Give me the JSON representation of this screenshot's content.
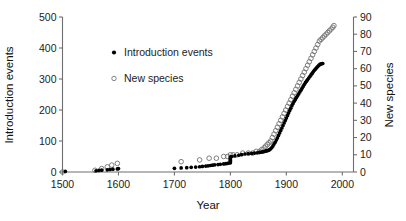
{
  "chart_data": {
    "type": "scatter",
    "title": "",
    "xlabel": "Year",
    "ylabel_left": "Introduction events",
    "ylabel_right": "New species",
    "xlim": [
      1500,
      2020
    ],
    "ylim_left": [
      0,
      500
    ],
    "ylim_right": [
      0,
      90
    ],
    "grid": false,
    "legend_position": "upper-left-inside",
    "xticks": [
      1500,
      1600,
      1700,
      1800,
      1900,
      2000
    ],
    "yticks_left": [
      0,
      100,
      200,
      300,
      400,
      500
    ],
    "yticks_right": [
      0,
      10,
      20,
      30,
      40,
      50,
      60,
      70,
      80,
      90
    ],
    "series": [
      {
        "name": "Introduction events",
        "marker": "filled-circle",
        "color": "#000000",
        "axis": "left",
        "x": [
          1505,
          1560,
          1565,
          1570,
          1580,
          1585,
          1590,
          1598,
          1600,
          1700,
          1712,
          1722,
          1730,
          1738,
          1745,
          1750,
          1756,
          1760,
          1764,
          1768,
          1772,
          1778,
          1782,
          1788,
          1792,
          1795,
          1798,
          1800,
          1800,
          1800,
          1800,
          1800,
          1800,
          1800,
          1802,
          1808,
          1815,
          1820,
          1826,
          1832,
          1838,
          1843,
          1848,
          1852,
          1855,
          1858,
          1860,
          1862,
          1864,
          1866,
          1868,
          1870,
          1872,
          1874,
          1876,
          1878,
          1880,
          1882,
          1884,
          1886,
          1888,
          1890,
          1892,
          1894,
          1896,
          1898,
          1900,
          1902,
          1904,
          1906,
          1908,
          1910,
          1912,
          1914,
          1916,
          1918,
          1920,
          1922,
          1924,
          1926,
          1928,
          1930,
          1932,
          1934,
          1936,
          1938,
          1940,
          1942,
          1944,
          1946,
          1948,
          1950,
          1952,
          1954,
          1956,
          1958,
          1960,
          1962,
          1964,
          1965
        ],
        "y": [
          2,
          4,
          5,
          6,
          7,
          8,
          9,
          10,
          11,
          12,
          13,
          14,
          15,
          16,
          17,
          18,
          19,
          20,
          21,
          22,
          23,
          24,
          25,
          26,
          27,
          28,
          29,
          30,
          33,
          36,
          39,
          42,
          45,
          48,
          50,
          52,
          54,
          56,
          58,
          59,
          60,
          61,
          62,
          63,
          64,
          65,
          66,
          67,
          68,
          69,
          70,
          72,
          75,
          79,
          84,
          90,
          96,
          103,
          110,
          118,
          126,
          134,
          142,
          150,
          158,
          166,
          174,
          182,
          190,
          198,
          206,
          214,
          221,
          228,
          234,
          240,
          246,
          252,
          258,
          264,
          270,
          276,
          282,
          288,
          293,
          298,
          303,
          308,
          313,
          318,
          323,
          328,
          332,
          336,
          340,
          344,
          347,
          349,
          350,
          350
        ]
      },
      {
        "name": "New species",
        "marker": "open-circle",
        "color": "#777777",
        "axis": "right",
        "x": [
          1500,
          1558,
          1570,
          1580,
          1588,
          1598,
          1712,
          1745,
          1762,
          1775,
          1788,
          1795,
          1800,
          1805,
          1812,
          1822,
          1832,
          1840,
          1846,
          1852,
          1856,
          1860,
          1863,
          1866,
          1869,
          1872,
          1875,
          1878,
          1881,
          1884,
          1887,
          1890,
          1893,
          1896,
          1899,
          1902,
          1905,
          1908,
          1911,
          1914,
          1917,
          1920,
          1923,
          1926,
          1929,
          1932,
          1935,
          1938,
          1941,
          1944,
          1947,
          1950,
          1953,
          1956,
          1959,
          1962,
          1965,
          1968,
          1971,
          1974,
          1977,
          1980,
          1983,
          1985
        ],
        "y": [
          0,
          1,
          2,
          3,
          4,
          5,
          6,
          7,
          8,
          8,
          9,
          9,
          10,
          10,
          10,
          11,
          11,
          11,
          12,
          12,
          13,
          14,
          15,
          16,
          17,
          18,
          20,
          22,
          24,
          26,
          28,
          30,
          32,
          34,
          36,
          38,
          40,
          42,
          44,
          46,
          48,
          50,
          52,
          54,
          56,
          58,
          60,
          62,
          64,
          66,
          68,
          70,
          72,
          74,
          76,
          77,
          78,
          79,
          80,
          81,
          82,
          83,
          84,
          85
        ]
      }
    ],
    "legend": [
      {
        "label": "Introduction events",
        "marker": "filled-circle"
      },
      {
        "label": "New species",
        "marker": "open-circle"
      }
    ]
  },
  "axes": {
    "x_title": "Year",
    "y_left_title": "Introduction events",
    "y_right_title": "New species",
    "x_tick_labels": [
      "1500",
      "1600",
      "1700",
      "1800",
      "1900",
      "2000"
    ],
    "y_left_tick_labels": [
      "500",
      "400",
      "300",
      "200",
      "100",
      "0"
    ],
    "y_right_tick_labels": [
      "90",
      "80",
      "70",
      "60",
      "50",
      "40",
      "30",
      "20",
      "10",
      "0"
    ]
  },
  "legend": {
    "entry_1_label": "Introduction events",
    "entry_2_label": "New species"
  },
  "colors": {
    "introduction_events": "#000000",
    "new_species": "#777777",
    "axis": "#6e6e6e",
    "background": "#ffffff"
  }
}
